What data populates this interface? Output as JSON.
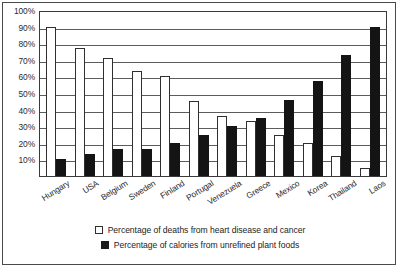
{
  "chart_data": {
    "type": "bar",
    "title": "",
    "xlabel": "",
    "ylabel": "",
    "ylim": [
      0,
      100
    ],
    "grid": true,
    "legend_position": "bottom",
    "categories": [
      "Hungary",
      "USA",
      "Belgium",
      "Sweden",
      "Finland",
      "Portugal",
      "Venezuela",
      "Greece",
      "Mexico",
      "Korea",
      "Thailand",
      "Laos"
    ],
    "y_ticks": [
      "10%",
      "20%",
      "30%",
      "40%",
      "50%",
      "60%",
      "70%",
      "80%",
      "90%",
      "100%"
    ],
    "y_tick_values": [
      10,
      20,
      30,
      40,
      50,
      60,
      70,
      80,
      90,
      100
    ],
    "series": [
      {
        "name": "Percentage of deaths from heart disease and cancer",
        "color": "#ffffff",
        "edge_color": "#2f2f2f",
        "values": [
          90,
          77,
          71,
          63,
          60,
          45,
          36,
          33,
          25,
          20,
          12,
          5
        ]
      },
      {
        "name": "Percentage of calories from unrefined plant foods",
        "color": "#141414",
        "edge_color": "#141414",
        "values": [
          10,
          13,
          16,
          16,
          20,
          25,
          30,
          35,
          46,
          57,
          73,
          90
        ]
      }
    ]
  },
  "legend": {
    "items": [
      {
        "swatch": "white-square",
        "label": "Percentage of deaths from heart disease and cancer"
      },
      {
        "swatch": "black-square",
        "label": "Percentage of calories from unrefined plant foods"
      }
    ]
  }
}
